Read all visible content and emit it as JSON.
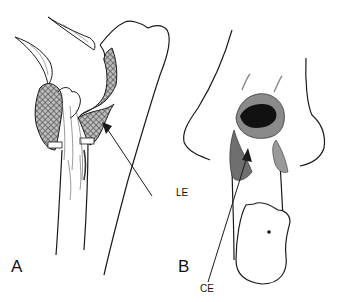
{
  "figure": {
    "panels": [
      {
        "id": "A",
        "label": "A",
        "view": "lateral view of elbow joint with shaded capsule"
      },
      {
        "id": "B",
        "label": "B",
        "view": "posterior view of elbow joint"
      }
    ],
    "annotations": [
      {
        "label": "LE",
        "panel": "A",
        "points_to": "cross-hatched capsular region"
      },
      {
        "label": "CE",
        "panel": "B",
        "points_to": "dark recess region"
      }
    ],
    "colors": {
      "line": "#1a1a1a",
      "hatch": "#555555",
      "dark_fill": "#111111",
      "background": "#ffffff"
    }
  }
}
